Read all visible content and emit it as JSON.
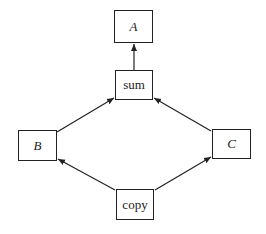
{
  "diagram": {
    "type": "dataflow-graph",
    "nodes": [
      {
        "id": "A",
        "label": "A",
        "italic": true
      },
      {
        "id": "sum",
        "label": "sum",
        "italic": false
      },
      {
        "id": "B",
        "label": "B",
        "italic": true
      },
      {
        "id": "C",
        "label": "C",
        "italic": true
      },
      {
        "id": "copy",
        "label": "copy",
        "italic": false
      }
    ],
    "edges": [
      {
        "from": "sum",
        "to": "A"
      },
      {
        "from": "B",
        "to": "sum"
      },
      {
        "from": "C",
        "to": "sum"
      },
      {
        "from": "copy",
        "to": "B"
      },
      {
        "from": "copy",
        "to": "C"
      }
    ],
    "colors": {
      "stroke": "#222222",
      "background": "#ffffff"
    }
  }
}
